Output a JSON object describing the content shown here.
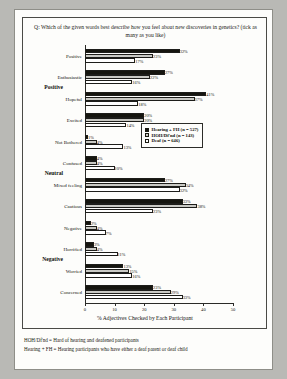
{
  "chart_data": {
    "type": "bar",
    "orientation": "horizontal",
    "title": "Q: Which of the given words best describe how you feel about new discoveries in genetics? (tick as many as you like)",
    "xlabel": "%  Adjectives Checked by Each Participant",
    "ylabel": "",
    "xlim": [
      0,
      50
    ],
    "xticks": [
      0,
      10,
      20,
      30,
      40,
      50
    ],
    "grid": false,
    "legend_position": "middle-right",
    "categories": [
      "Positive",
      "Enthusiastic",
      "Hopeful",
      "Excited",
      "Not Bothered",
      "Confused",
      "Mixed feeling",
      "Cautious",
      "Negative",
      "Horrified",
      "Worried",
      "Concerned"
    ],
    "groups": [
      {
        "label": "Positive",
        "categories": [
          "Positive",
          "Enthusiastic",
          "Hopeful",
          "Excited"
        ]
      },
      {
        "label": "Neutral",
        "categories": [
          "Not Bothered",
          "Confused",
          "Mixed feeling",
          "Cautious"
        ]
      },
      {
        "label": "Negative",
        "categories": [
          "Negative",
          "Horrified",
          "Worried",
          "Concerned"
        ]
      }
    ],
    "series": [
      {
        "name": "Hearing + FH (n = 527)",
        "color": "#15150f",
        "values": [
          32,
          27,
          41,
          20,
          1,
          4,
          27,
          33,
          2,
          3,
          13,
          23
        ],
        "labels": [
          "32%",
          "27%",
          "41%",
          "20%",
          "1%",
          "4%",
          "27%",
          "33%",
          "2%",
          "3%",
          "13%",
          "23%"
        ]
      },
      {
        "name": "HOH/Df'nd (n = 143)",
        "color": "#c9c9c4",
        "values": [
          23,
          22,
          37,
          20,
          4,
          4,
          34,
          38,
          4,
          4,
          15,
          29
        ],
        "labels": [
          "23%",
          "22%",
          "37%",
          "20%",
          "4%",
          "4%",
          "34%",
          "38%",
          "4%",
          "4%",
          "15%",
          "29%"
        ]
      },
      {
        "name": "Deaf (n = 646)",
        "color": "#ffffff",
        "values": [
          17,
          16,
          18,
          14,
          13,
          10,
          32,
          23,
          7,
          11,
          16,
          33
        ],
        "labels": [
          "17%",
          "16%",
          "18%",
          "14%",
          "13%",
          "10%",
          "32%",
          "23%",
          "7%",
          "11%",
          "16%",
          "33%"
        ]
      }
    ]
  },
  "legend": {
    "items": [
      {
        "label": "Hearing + FH (n = 527)"
      },
      {
        "label": "HOH/Df'nd (n = 143)"
      },
      {
        "label": "Deaf (n = 646)"
      }
    ]
  },
  "footnotes": [
    "HOH/Df'nd = Hard of hearing and deafened participants",
    "Hearing + FH = Hearing participants who have either a deaf parent or deaf child"
  ]
}
